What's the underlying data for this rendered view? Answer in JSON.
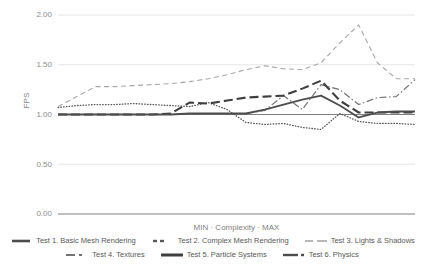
{
  "axes": {
    "y_title": "FPS",
    "x_title": "MIN · Complexity · MAX",
    "y_ticks": [
      "2.00",
      "1.50",
      "1.00",
      "0.50",
      "0.00"
    ]
  },
  "legend": {
    "rows": [
      [
        {
          "key": "t1",
          "label": "Test 1. Basic Mesh Rendering",
          "swatch": "solid-thick-short"
        },
        {
          "key": "t2",
          "label": "Test 2. Complex Mesh Rendering",
          "swatch": "dotted"
        },
        {
          "key": "t3",
          "label": "Test 3. Lights & Shadows",
          "swatch": "dashed"
        }
      ],
      [
        {
          "key": "t4",
          "label": "Test 4. Textures",
          "swatch": "dashdot"
        },
        {
          "key": "t5",
          "label": "Test 5. Particle Systems",
          "swatch": "longdash-thick"
        },
        {
          "key": "t6",
          "label": "Test 6. Physics",
          "swatch": "solid-dot"
        }
      ]
    ]
  },
  "chart_data": {
    "type": "line",
    "title": "",
    "xlabel": "MIN · Complexity · MAX",
    "ylabel": "FPS",
    "ylim": [
      0.0,
      2.0
    ],
    "yticks": [
      0.0,
      0.5,
      1.0,
      1.5,
      2.0
    ],
    "grid": true,
    "legend_position": "bottom",
    "x": [
      0,
      1,
      2,
      3,
      4,
      5,
      6,
      7,
      8,
      9,
      10,
      11,
      12,
      13,
      14,
      15,
      16,
      17,
      18,
      19
    ],
    "series": [
      {
        "name": "Test 1. Basic Mesh Rendering",
        "style": "solid-thin",
        "color": "#808080",
        "values": [
          1.0,
          1.0,
          1.0,
          1.0,
          1.0,
          1.0,
          1.0,
          1.0,
          1.0,
          1.0,
          1.0,
          1.0,
          1.0,
          1.0,
          1.0,
          1.0,
          1.0,
          1.0,
          1.0,
          1.0
        ]
      },
      {
        "name": "Test 2. Complex Mesh Rendering",
        "style": "dotted",
        "color": "#595959",
        "values": [
          1.07,
          1.09,
          1.1,
          1.1,
          1.11,
          1.1,
          1.09,
          1.08,
          1.12,
          1.05,
          0.92,
          0.9,
          0.91,
          0.87,
          0.85,
          1.01,
          0.93,
          0.91,
          0.91,
          0.9
        ]
      },
      {
        "name": "Test 3. Lights & Shadows",
        "style": "dashed",
        "color": "#a6a6a6",
        "values": [
          1.08,
          1.18,
          1.28,
          1.28,
          1.29,
          1.3,
          1.31,
          1.33,
          1.36,
          1.4,
          1.45,
          1.49,
          1.46,
          1.45,
          1.52,
          1.72,
          1.9,
          1.52,
          1.36,
          1.36
        ]
      },
      {
        "name": "Test 4. Textures",
        "style": "dashdot",
        "color": "#737373",
        "values": [
          1.0,
          1.0,
          1.0,
          1.0,
          1.0,
          1.0,
          1.0,
          1.0,
          1.01,
          1.01,
          1.01,
          1.04,
          1.19,
          1.05,
          1.3,
          1.25,
          1.1,
          1.17,
          1.18,
          1.35
        ]
      },
      {
        "name": "Test 5. Particle Systems",
        "style": "longdash-thick",
        "color": "#3f3f3f",
        "values": [
          1.0,
          1.0,
          1.0,
          1.0,
          1.0,
          1.0,
          1.01,
          1.12,
          1.11,
          1.14,
          1.17,
          1.18,
          1.19,
          1.26,
          1.34,
          1.14,
          1.02,
          1.02,
          1.02,
          1.02
        ]
      },
      {
        "name": "Test 6. Physics",
        "style": "solid-thick",
        "color": "#4d4d4d",
        "values": [
          1.0,
          1.0,
          1.0,
          1.0,
          1.0,
          1.0,
          1.0,
          1.01,
          1.01,
          1.01,
          1.01,
          1.05,
          1.1,
          1.15,
          1.19,
          1.09,
          0.97,
          1.02,
          1.03,
          1.03
        ]
      }
    ]
  }
}
